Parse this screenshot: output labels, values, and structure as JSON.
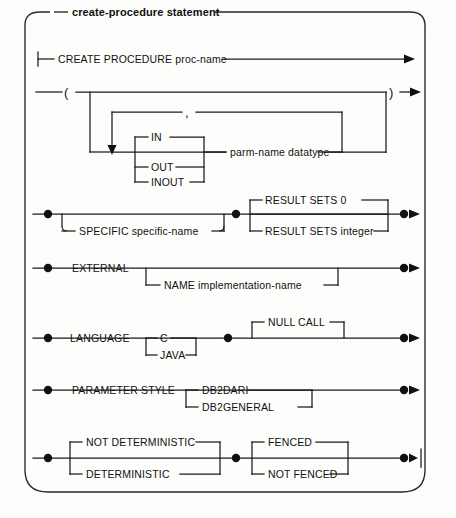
{
  "diagram": {
    "title": "create-procedure statement",
    "type": "railroad-syntax-diagram",
    "rows": {
      "row1": {
        "tokens": [
          "CREATE",
          "PROCEDURE",
          "proc-name"
        ],
        "label": "CREATE PROCEDURE proc-name"
      },
      "row2": {
        "open_paren": "(",
        "close_paren": ")",
        "separator": ",",
        "modes": [
          "IN",
          "OUT",
          "INOUT"
        ],
        "parm": "parm-name  datatype"
      },
      "row3": {
        "specific_keyword": "SPECIFIC",
        "specific_value": "specific-name",
        "specific_label": "SPECIFIC  specific-name",
        "result_sets_zero": "RESULT SETS  0",
        "result_sets_integer": "RESULT SETS  integer"
      },
      "row4": {
        "external": "EXTERNAL",
        "name_label": "NAME  implementation-name"
      },
      "row5": {
        "language": "LANGUAGE",
        "options": [
          "C",
          "JAVA"
        ],
        "null_call": "NULL CALL"
      },
      "row6": {
        "parameter_style": "PARAMETER  STYLE",
        "options": [
          "DB2DARI",
          "DB2GENERAL"
        ]
      },
      "row7": {
        "not_deterministic": "NOT DETERMINISTIC",
        "deterministic": "DETERMINISTIC",
        "fenced": "FENCED",
        "not_fenced": "NOT FENCED"
      }
    },
    "colors": {
      "line": "#1a1a1a",
      "frame": "#2b2b2b",
      "background": "#fdfdfc",
      "text": "#111111"
    }
  }
}
